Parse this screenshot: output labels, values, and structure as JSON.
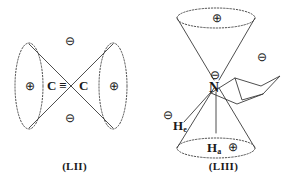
{
  "figure": {
    "background_color": "#ffffff",
    "line_color": "#3a3a3a",
    "text_color": "#1a1a1a",
    "structures": [
      {
        "id": "LII",
        "caption": "(LII)",
        "description": "acetylene pi-orbital lobes",
        "atoms": [
          {
            "name": "carbon-left",
            "label": "C"
          },
          {
            "name": "carbon-right",
            "label": "C"
          }
        ],
        "bond": {
          "type": "triple",
          "glyph": "≡"
        },
        "charges": [
          {
            "name": "charge-top",
            "symbol": "⊖",
            "sign": "minus"
          },
          {
            "name": "charge-bottom",
            "symbol": "⊖",
            "sign": "minus"
          },
          {
            "name": "charge-left",
            "symbol": "⊕",
            "sign": "plus"
          },
          {
            "name": "charge-right",
            "symbol": "⊕",
            "sign": "plus"
          }
        ]
      },
      {
        "id": "LIII",
        "caption": "(LIII)",
        "description": "N-lone-pair cone on piperidine chair ring",
        "atoms": [
          {
            "name": "nitrogen",
            "label": "N"
          },
          {
            "name": "hydrogen-equatorial",
            "label": "H",
            "subscript": "e"
          },
          {
            "name": "hydrogen-axial",
            "label": "H",
            "subscript": "a"
          }
        ],
        "charges": [
          {
            "name": "charge-top-cone",
            "symbol": "⊕",
            "sign": "plus"
          },
          {
            "name": "charge-right-cone",
            "symbol": "⊖",
            "sign": "minus"
          },
          {
            "name": "charge-nitrogen",
            "symbol": "⊖",
            "sign": "minus"
          },
          {
            "name": "charge-hydrogen-equatorial",
            "symbol": "⊖",
            "sign": "minus"
          },
          {
            "name": "charge-hydrogen-axial",
            "symbol": "⊕",
            "sign": "plus"
          }
        ]
      }
    ]
  }
}
